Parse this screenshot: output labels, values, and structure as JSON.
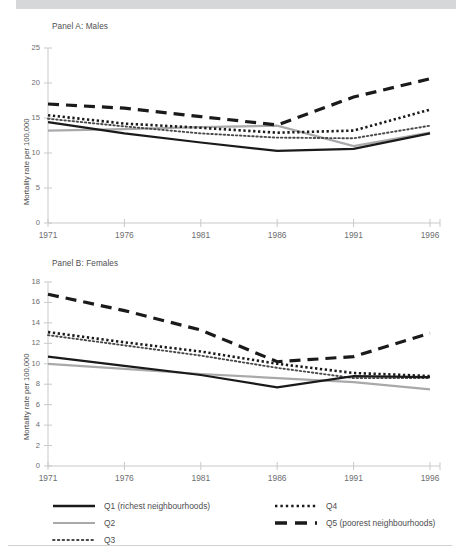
{
  "figure": {
    "y_axis_label": "Mortality rate per 100,000"
  },
  "legend": {
    "items": [
      {
        "key": "Q1",
        "label": "Q1 (richest neighbourhoods)",
        "style": "solid-black"
      },
      {
        "key": "Q2",
        "label": "Q2",
        "style": "solid-gray"
      },
      {
        "key": "Q3",
        "label": "Q3",
        "style": "fine-dotted"
      },
      {
        "key": "Q4",
        "label": "Q4",
        "style": "bold-dotted"
      },
      {
        "key": "Q5",
        "label": "Q5 (poorest neighbourhoods)",
        "style": "dashed-black"
      }
    ]
  },
  "colors": {
    "black": "#1a1a1a",
    "gray": "#a8a9ab",
    "axis": "#c8c9cb",
    "text": "#58585a",
    "band": "#d6d7d8"
  },
  "chart_data": [
    {
      "id": "panel-a",
      "type": "line",
      "title": "Panel A:  Males",
      "xlabel": "",
      "ylabel": "Mortality rate per 100,000",
      "x": [
        1971,
        1976,
        1981,
        1986,
        1991,
        1996
      ],
      "xtick_labels": [
        "1971",
        "1976",
        "1981",
        "1986",
        "1991",
        "1996"
      ],
      "ytick_labels": [
        "0",
        "5",
        "10",
        "15",
        "20",
        "25"
      ],
      "ylim": [
        0,
        25
      ],
      "ytick_step": 5,
      "grid": false,
      "series": [
        {
          "name": "Q1 (richest neighbourhoods)",
          "style": "solid-black",
          "values": [
            14.4,
            12.8,
            11.5,
            10.3,
            10.6,
            12.8
          ]
        },
        {
          "name": "Q2",
          "style": "solid-gray",
          "values": [
            13.2,
            13.4,
            13.7,
            13.9,
            11.0,
            12.9
          ]
        },
        {
          "name": "Q3",
          "style": "fine-dotted",
          "values": [
            14.9,
            13.8,
            12.8,
            12.2,
            12.1,
            13.9
          ]
        },
        {
          "name": "Q4",
          "style": "bold-dotted",
          "values": [
            15.4,
            14.2,
            13.6,
            12.9,
            13.2,
            16.2
          ]
        },
        {
          "name": "Q5 (poorest neighbourhoods)",
          "style": "dashed-black",
          "values": [
            17.0,
            16.4,
            15.2,
            14.0,
            18.0,
            20.6
          ]
        }
      ]
    },
    {
      "id": "panel-b",
      "type": "line",
      "title": "Panel B:  Females",
      "xlabel": "",
      "ylabel": "Mortality rate per 100,000",
      "x": [
        1971,
        1976,
        1981,
        1986,
        1991,
        1996
      ],
      "xtick_labels": [
        "1971",
        "1976",
        "1981",
        "1986",
        "1991",
        "1996"
      ],
      "ytick_labels": [
        "0",
        "2",
        "4",
        "6",
        "8",
        "10",
        "12",
        "14",
        "16",
        "18"
      ],
      "ylim": [
        0,
        18
      ],
      "ytick_step": 2,
      "grid": false,
      "series": [
        {
          "name": "Q1 (richest neighbourhoods)",
          "style": "solid-black",
          "values": [
            10.7,
            9.8,
            8.9,
            7.7,
            8.8,
            8.7
          ]
        },
        {
          "name": "Q2",
          "style": "solid-gray",
          "values": [
            10.0,
            9.5,
            9.0,
            8.6,
            8.2,
            7.5
          ]
        },
        {
          "name": "Q3",
          "style": "fine-dotted",
          "values": [
            12.8,
            11.8,
            10.8,
            9.6,
            8.6,
            8.6
          ]
        },
        {
          "name": "Q4",
          "style": "bold-dotted",
          "values": [
            13.1,
            12.1,
            11.2,
            10.0,
            9.1,
            8.8
          ]
        },
        {
          "name": "Q5 (poorest neighbourhoods)",
          "style": "dashed-black",
          "values": [
            16.8,
            15.2,
            13.3,
            10.2,
            10.7,
            13.0
          ]
        }
      ]
    }
  ]
}
